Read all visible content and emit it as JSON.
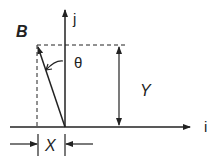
{
  "diagram": {
    "vector_label": "B",
    "axis_vertical_label": "j",
    "axis_horizontal_label": "i",
    "angle_label": "θ",
    "dimension_vertical_label": "Y",
    "dimension_horizontal_label": "X",
    "colors": {
      "stroke": "#222222",
      "background": "#ffffff"
    }
  }
}
